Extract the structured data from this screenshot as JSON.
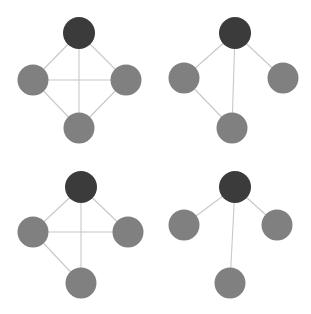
{
  "figure": {
    "title": "",
    "background_color": "#ffffff",
    "width": 311,
    "height": 314,
    "layout": "2x2 grid of node-link graphs"
  },
  "style": {
    "edge_color": "#c8c8c8",
    "edge_width": 1.1,
    "node_radius": 15.5,
    "node_dark_color": "#3b3b3b",
    "node_light_color": "#808080"
  },
  "legend": {
    "dark_node_role": "root",
    "light_node_role": "leaf"
  },
  "chart_data": {
    "type": "diagram",
    "subtype": "node-link graph grid",
    "panels": [
      {
        "id": "panel-top-left",
        "name": "complete-graph",
        "edge_count": 6,
        "nodes": [
          {
            "id": "top",
            "x": 79,
            "y": 33,
            "color": "#3b3b3b",
            "r": 16,
            "role": "root"
          },
          {
            "id": "left",
            "x": 33,
            "y": 80,
            "color": "#808080",
            "r": 15.5,
            "role": "leaf"
          },
          {
            "id": "right",
            "x": 126,
            "y": 80,
            "color": "#808080",
            "r": 15.5,
            "role": "leaf"
          },
          {
            "id": "bottom",
            "x": 79,
            "y": 128,
            "color": "#808080",
            "r": 15.5,
            "role": "leaf"
          }
        ],
        "edges": [
          [
            "top",
            "left"
          ],
          [
            "top",
            "right"
          ],
          [
            "top",
            "bottom"
          ],
          [
            "left",
            "right"
          ],
          [
            "left",
            "bottom"
          ],
          [
            "right",
            "bottom"
          ]
        ]
      },
      {
        "id": "panel-top-right",
        "name": "path-plus-branch-graph",
        "edge_count": 4,
        "nodes": [
          {
            "id": "top",
            "x": 235,
            "y": 33,
            "color": "#3b3b3b",
            "r": 16,
            "role": "root"
          },
          {
            "id": "left",
            "x": 184,
            "y": 78,
            "color": "#808080",
            "r": 15.5,
            "role": "leaf"
          },
          {
            "id": "right",
            "x": 283,
            "y": 78,
            "color": "#808080",
            "r": 15.5,
            "role": "leaf"
          },
          {
            "id": "bottom",
            "x": 232,
            "y": 128,
            "color": "#808080",
            "r": 15.5,
            "role": "leaf"
          }
        ],
        "edges": [
          [
            "top",
            "left"
          ],
          [
            "top",
            "right"
          ],
          [
            "top",
            "bottom"
          ],
          [
            "left",
            "bottom"
          ]
        ]
      },
      {
        "id": "panel-bottom-left",
        "name": "near-complete-graph",
        "edge_count": 5,
        "nodes": [
          {
            "id": "top",
            "x": 81,
            "y": 187,
            "color": "#3b3b3b",
            "r": 16,
            "role": "root"
          },
          {
            "id": "left",
            "x": 33,
            "y": 232,
            "color": "#808080",
            "r": 15.5,
            "role": "leaf"
          },
          {
            "id": "right",
            "x": 128,
            "y": 232,
            "color": "#808080",
            "r": 15.5,
            "role": "leaf"
          },
          {
            "id": "bottom",
            "x": 81,
            "y": 283,
            "color": "#808080",
            "r": 15.5,
            "role": "leaf"
          }
        ],
        "edges": [
          [
            "top",
            "left"
          ],
          [
            "top",
            "right"
          ],
          [
            "top",
            "bottom"
          ],
          [
            "left",
            "right"
          ],
          [
            "left",
            "bottom"
          ]
        ]
      },
      {
        "id": "panel-bottom-right",
        "name": "star-graph",
        "edge_count": 3,
        "nodes": [
          {
            "id": "top",
            "x": 235,
            "y": 187,
            "color": "#3b3b3b",
            "r": 16,
            "role": "root"
          },
          {
            "id": "left",
            "x": 184,
            "y": 225,
            "color": "#808080",
            "r": 15.5,
            "role": "leaf"
          },
          {
            "id": "right",
            "x": 277,
            "y": 225,
            "color": "#808080",
            "r": 15.5,
            "role": "leaf"
          },
          {
            "id": "bottom",
            "x": 230,
            "y": 283,
            "color": "#808080",
            "r": 15.5,
            "role": "leaf"
          }
        ],
        "edges": [
          [
            "top",
            "left"
          ],
          [
            "top",
            "right"
          ],
          [
            "top",
            "bottom"
          ]
        ]
      }
    ]
  }
}
